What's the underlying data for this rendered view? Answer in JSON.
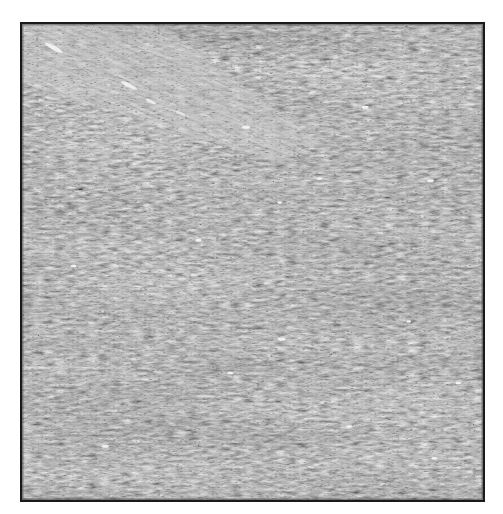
{
  "image": {
    "kind": "histology-micrograph",
    "description": "Grayscale photomicrograph of densely cellular spindle-cell tissue arranged in intersecting fascicles, enclosed in a thin black border",
    "color_mode": "grayscale",
    "frame": {
      "x": 20,
      "y": 22,
      "width": 465,
      "height": 480,
      "border_color": "#1a1a1a"
    },
    "tones": {
      "background": "#ffffff",
      "tissue_mid": "#8a8a8a",
      "nuclei_dark": "#2e2e2e",
      "stroma_light": "#d8d8d8",
      "vessel_highlight": "#f4f4f4"
    },
    "features": [
      {
        "name": "diagonal-fascicle-streak",
        "from": [
          30,
          40
        ],
        "to": [
          160,
          100
        ]
      },
      {
        "name": "horizontal-fascicles",
        "orientation": "horizontal"
      },
      {
        "name": "white-specks",
        "count": 14
      }
    ]
  }
}
